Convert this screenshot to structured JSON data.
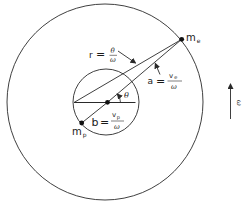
{
  "diagram": {
    "type": "geometry",
    "colors": {
      "stroke": "#2a2a2a",
      "background": "#ffffff"
    },
    "outer_circle": {
      "cx": 105,
      "cy": 102,
      "r": 98
    },
    "inner_circle": {
      "cx": 106,
      "cy": 102,
      "r": 33
    },
    "points": {
      "center": {
        "x": 107.5,
        "y": 102.3
      },
      "m_e": {
        "x": 181.7,
        "y": 39.3
      },
      "m_p": {
        "x": 81.7,
        "y": 123
      }
    },
    "labels": {
      "m_e": {
        "main": "m",
        "sub": "e"
      },
      "m_p": {
        "main": "m",
        "sub": "p"
      },
      "r": {
        "lhs": "r",
        "eq": "=",
        "num": "θ",
        "den": "ω"
      },
      "a": {
        "lhs": "a",
        "eq": "=",
        "num_main": "v",
        "num_sub": "e",
        "den": "ω"
      },
      "b": {
        "lhs": "b",
        "eq": "=",
        "num_main": "v",
        "num_sub": "p",
        "den": "ω"
      },
      "theta": "θ",
      "omega": "ω"
    }
  }
}
